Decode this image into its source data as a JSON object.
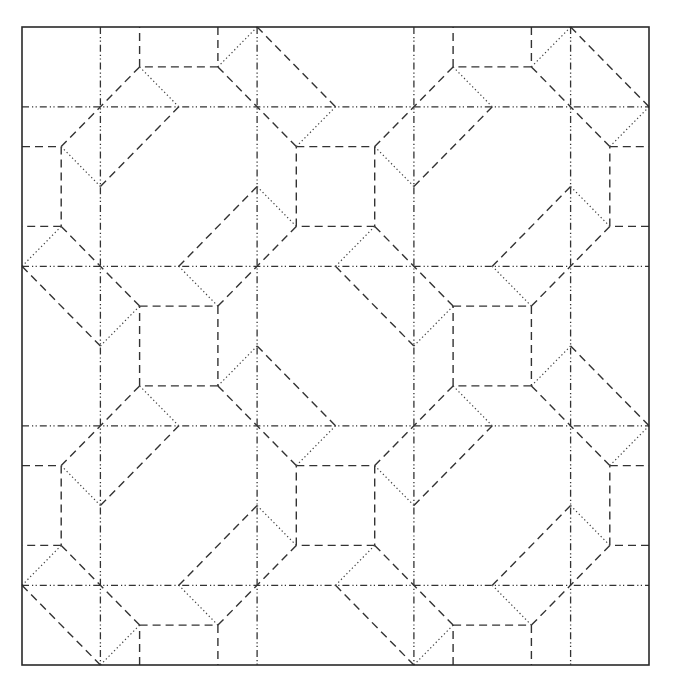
{
  "diagram": {
    "type": "origami-crease-pattern",
    "grid_units": 16,
    "period": 8,
    "frame_px": {
      "x0": 22,
      "y0": 27,
      "x1": 649,
      "y1": 665
    },
    "colors": {
      "line": "#333333",
      "background": "#ffffff"
    },
    "line_styles": {
      "border": "solid",
      "mountain": "dash-dot-dot",
      "valley": "dashed",
      "secondary": "dotted"
    },
    "mountain_grid": {
      "vertical_u": [
        2,
        6,
        10,
        14
      ],
      "horizontal_v": [
        2,
        6,
        10,
        14
      ]
    },
    "tile_offsets": [
      [
        -8,
        -8
      ],
      [
        0,
        -8
      ],
      [
        8,
        -8
      ],
      [
        16,
        -8
      ],
      [
        -8,
        0
      ],
      [
        0,
        0
      ],
      [
        8,
        0
      ],
      [
        16,
        0
      ],
      [
        -8,
        8
      ],
      [
        0,
        8
      ],
      [
        8,
        8
      ],
      [
        16,
        8
      ],
      [
        -8,
        16
      ],
      [
        0,
        16
      ],
      [
        8,
        16
      ],
      [
        16,
        16
      ]
    ],
    "base_segments": {
      "valley": [
        [
          3,
          7,
          5,
          7
        ],
        [
          5,
          7,
          5,
          9
        ],
        [
          5,
          9,
          3,
          9
        ],
        [
          3,
          9,
          3,
          7
        ],
        [
          7,
          3,
          9,
          3
        ],
        [
          9,
          3,
          9,
          5
        ],
        [
          9,
          5,
          7,
          5
        ],
        [
          7,
          5,
          7,
          3
        ],
        [
          5,
          7,
          7,
          5
        ],
        [
          1,
          5,
          3,
          7
        ],
        [
          5,
          1,
          7,
          3
        ],
        [
          3,
          1,
          1,
          3
        ],
        [
          8,
          2,
          6,
          0
        ],
        [
          10,
          4,
          12,
          2
        ],
        [
          8,
          6,
          10,
          8
        ],
        [
          6,
          4,
          4,
          6
        ]
      ],
      "dotted": [
        [
          7,
          3,
          8,
          2
        ],
        [
          9,
          3,
          10,
          4
        ],
        [
          9,
          5,
          8,
          6
        ],
        [
          7,
          5,
          6,
          4
        ],
        [
          3,
          7,
          2,
          8
        ],
        [
          5,
          7,
          4,
          6
        ],
        [
          5,
          9,
          6,
          8
        ],
        [
          3,
          9,
          4,
          10
        ]
      ]
    }
  }
}
